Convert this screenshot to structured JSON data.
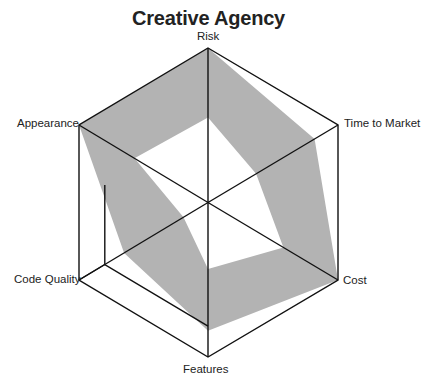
{
  "chart_data": {
    "type": "radar",
    "title": "Creative Agency",
    "axes": [
      "Risk",
      "Time to Market",
      "Cost",
      "Features",
      "Code Quality",
      "Appearance"
    ],
    "range": [
      0,
      10
    ],
    "grid": {
      "outer_ring": true,
      "partial_inner_ring_fraction": 0.8,
      "spokes": true
    },
    "series": [
      {
        "name": "Upper bound",
        "values": [
          10,
          8.2,
          10,
          8.3,
          6.5,
          10
        ]
      },
      {
        "name": "Lower bound",
        "values": [
          5.5,
          3.7,
          5.8,
          4.3,
          1.9,
          5.7
        ]
      }
    ],
    "fill": "band between lower and upper bound",
    "colors": {
      "band": "#b3b3b3",
      "grid": "#111111",
      "text": "#222222",
      "background": "#ffffff"
    }
  }
}
